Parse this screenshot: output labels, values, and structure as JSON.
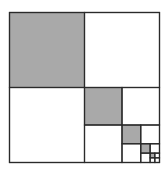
{
  "diagram": {
    "colors": {
      "background": "#ffffff",
      "shade": "#a9a9a9",
      "stroke": "#2a2a2a"
    },
    "outer": {
      "x": 9.5,
      "y": 12.5,
      "size": 150
    },
    "levels": 5,
    "shaded_position": "top-left",
    "recursion_position": "bottom-right"
  }
}
